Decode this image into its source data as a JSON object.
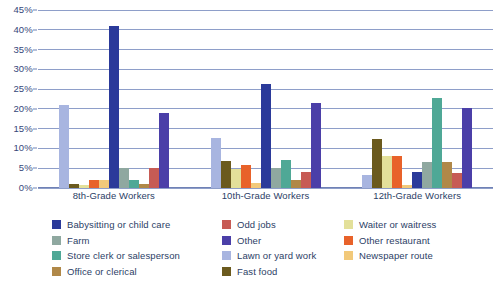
{
  "chart_data": {
    "type": "bar",
    "title": "",
    "subtitle": "",
    "xlabel": "",
    "ylabel": "",
    "ylim": [
      0,
      45
    ],
    "ytick_labels": [
      "0%",
      "5%",
      "10%",
      "15%",
      "20%",
      "25%",
      "30%",
      "35%",
      "40%",
      "45%"
    ],
    "ytick_values": [
      0,
      5,
      10,
      15,
      20,
      25,
      30,
      35,
      40,
      45
    ],
    "grid": true,
    "legend_position": "bottom",
    "categories": [
      "8th-Grade Workers",
      "10th-Grade Workers",
      "12th-Grade Workers"
    ],
    "series": [
      {
        "name": "Lawn or yard work",
        "color": "#A8B5E0",
        "values": [
          21.0,
          12.7,
          3.2
        ]
      },
      {
        "name": "Fast food",
        "color": "#6B5A1E",
        "values": [
          1.0,
          6.8,
          12.5
        ]
      },
      {
        "name": "Waiter or waitress",
        "color": "#E3E09A",
        "values": [
          0.8,
          4.8,
          8.0
        ]
      },
      {
        "name": "Other restaurant",
        "color": "#E8622A",
        "values": [
          2.0,
          5.7,
          8.0
        ]
      },
      {
        "name": "Newspaper route",
        "color": "#F2C97A",
        "values": [
          2.0,
          1.2,
          0.8
        ]
      },
      {
        "name": "Babysitting or child care",
        "color": "#2B3A9A",
        "values": [
          41.0,
          26.3,
          4.0
        ]
      },
      {
        "name": "Farm",
        "color": "#8FA8A0",
        "values": [
          5.1,
          5.0,
          6.6
        ]
      },
      {
        "name": "Store clerk or salesperson",
        "color": "#4FA896",
        "values": [
          2.1,
          7.0,
          22.8
        ]
      },
      {
        "name": "Office or clerical",
        "color": "#B08848",
        "values": [
          0.9,
          2.0,
          6.5
        ]
      },
      {
        "name": "Odd jobs",
        "color": "#C75B55",
        "values": [
          5.0,
          4.0,
          3.8
        ]
      },
      {
        "name": "Other",
        "color": "#4B3FA8",
        "values": [
          19.0,
          21.5,
          20.2
        ]
      }
    ]
  },
  "legend": {
    "columns": [
      [
        {
          "label": "Babysitting or child care",
          "color": "#2B3A9A",
          "icon": "legend-swatch"
        },
        {
          "label": "Farm",
          "color": "#8FA8A0",
          "icon": "legend-swatch"
        },
        {
          "label": "Store clerk or salesperson",
          "color": "#4FA896",
          "icon": "legend-swatch"
        },
        {
          "label": "Office or clerical",
          "color": "#B08848",
          "icon": "legend-swatch"
        }
      ],
      [
        {
          "label": "Odd jobs",
          "color": "#C75B55",
          "icon": "legend-swatch"
        },
        {
          "label": "Other",
          "color": "#4B3FA8",
          "icon": "legend-swatch"
        },
        {
          "label": "Lawn or yard work",
          "color": "#A8B5E0",
          "icon": "legend-swatch"
        },
        {
          "label": "Fast food",
          "color": "#6B5A1E",
          "icon": "legend-swatch"
        }
      ],
      [
        {
          "label": "Waiter or waitress",
          "color": "#E3E09A",
          "icon": "legend-swatch"
        },
        {
          "label": "Other restaurant",
          "color": "#E8622A",
          "icon": "legend-swatch"
        },
        {
          "label": "Newspaper route",
          "color": "#F2C97A",
          "icon": "legend-swatch"
        }
      ]
    ]
  },
  "colors": {
    "grid": "#8e9ec9",
    "axis": "#6f81b5",
    "text": "#2c3e66",
    "background": "#ffffff"
  }
}
